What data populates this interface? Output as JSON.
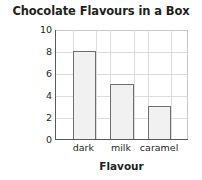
{
  "chart_data": {
    "type": "bar",
    "title": "Chocolate Flavours in a Box",
    "xlabel": "Flavour",
    "ylabel": "No. of Chocolates",
    "categories": [
      "dark",
      "milk",
      "caramel"
    ],
    "values": [
      8,
      5,
      3
    ],
    "ylim": [
      0,
      10
    ],
    "yticks": [
      0,
      2,
      4,
      6,
      8,
      10
    ],
    "ytick_labels": [
      "0",
      "2",
      "4",
      "6",
      "8",
      "10"
    ],
    "grid": true,
    "legend": null,
    "colors": {
      "bar_fill": "#f1f1f1",
      "bar_edge": "#6d6e70",
      "axis": "#58595b",
      "grid": "#dcdcdc",
      "text": "#231f20",
      "background": "#ffffff"
    }
  }
}
